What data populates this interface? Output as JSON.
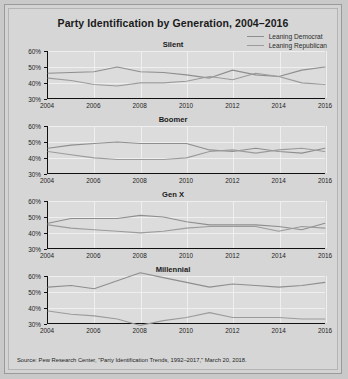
{
  "chart_data": {
    "type": "line",
    "title": "Party Identification by Generation, 2004–2016",
    "xlabel": "",
    "ylabel": "",
    "x": [
      2004,
      2005,
      2006,
      2007,
      2008,
      2009,
      2010,
      2011,
      2012,
      2013,
      2014,
      2015,
      2016
    ],
    "xticks": [
      "2004",
      "2006",
      "2008",
      "2010",
      "2012",
      "2014",
      "2016"
    ],
    "yticks": [
      "30%",
      "40%",
      "50%",
      "60%"
    ],
    "ylim": [
      30,
      60
    ],
    "xlim": [
      2004,
      2016
    ],
    "grid": true,
    "legend": [
      "Leaning Democrat",
      "Leaning Republican"
    ],
    "legend_position": "top-right",
    "panels": [
      {
        "name": "Silent",
        "series": [
          {
            "name": "Leaning Democrat",
            "values": [
              46,
              46.5,
              47,
              50,
              47,
              46.5,
              45,
              43,
              48,
              45,
              44,
              48,
              50
            ]
          },
          {
            "name": "Leaning Republican",
            "values": [
              43,
              41.5,
              39,
              38,
              40,
              40,
              41,
              44,
              42,
              46,
              44,
              40,
              39
            ]
          }
        ]
      },
      {
        "name": "Boomer",
        "series": [
          {
            "name": "Leaning Democrat",
            "values": [
              46,
              48,
              49,
              50,
              49,
              49,
              49,
              45,
              44,
              46,
              44,
              43,
              46
            ]
          },
          {
            "name": "Leaning Republican",
            "values": [
              44,
              42,
              40,
              39,
              39,
              39,
              40,
              44,
              45,
              43,
              45,
              46,
              44
            ]
          }
        ]
      },
      {
        "name": "Gen X",
        "series": [
          {
            "name": "Leaning Democrat",
            "values": [
              46,
              49,
              49,
              49,
              51,
              50,
              47,
              45,
              45,
              45,
              44,
              42,
              46
            ]
          },
          {
            "name": "Leaning Republican",
            "values": [
              45,
              43,
              42,
              41,
              40,
              41,
              43,
              44,
              44,
              44,
              41,
              44,
              43
            ]
          }
        ]
      },
      {
        "name": "Millennial",
        "series": [
          {
            "name": "Leaning Democrat",
            "values": [
              53,
              54,
              52,
              57,
              62,
              59,
              56,
              53,
              55,
              54,
              53,
              54,
              56
            ]
          },
          {
            "name": "Leaning Republican",
            "values": [
              38,
              36,
              35,
              33,
              29,
              32,
              34,
              37,
              34,
              34,
              34,
              33,
              33
            ]
          }
        ]
      }
    ]
  },
  "source": {
    "text": "Source: Pew Research Center, \"Party Identification Trends, 1992–2017,\" March 20, 2018."
  },
  "colors": {
    "democrat_line": "#8e8e8e",
    "republican_line": "#9b9b9b",
    "axis": "#111111",
    "gridline": "#efefef",
    "plot_background": "#dcdcdc",
    "figure_background": "#d6d6d6"
  }
}
